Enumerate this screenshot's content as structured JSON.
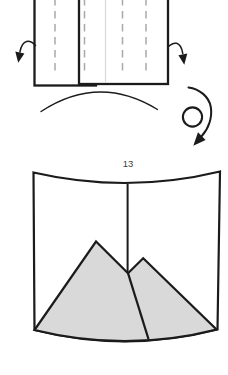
{
  "figure": {
    "step_number": "13"
  },
  "colors": {
    "background": "#ffffff",
    "outline": "#1b1b1b",
    "fold_dash": "#a9a9a9",
    "crease": "#d8d8d8",
    "paper_fill": "#ffffff",
    "shade_fill": "#d9d9d9",
    "step_label": "#3d3d3d"
  },
  "icons": {
    "curl_left_arrow": "hooked-arrow-down-left",
    "curl_right_arrow": "hooked-arrow-down-right",
    "sweep_arc": "motion-arc-line",
    "rotate_arrow": "rotate-clockwise-arrow"
  }
}
